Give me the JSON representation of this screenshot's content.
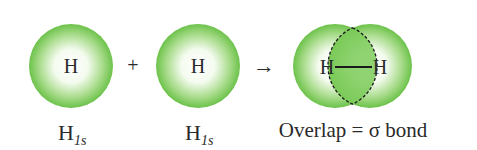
{
  "diagram": {
    "atoms": [
      {
        "symbol": "H",
        "label_main": "H",
        "label_sub": "1s"
      },
      {
        "symbol": "H",
        "label_main": "H",
        "label_sub": "1s"
      }
    ],
    "plus": "+",
    "arrow": "→",
    "molecule": {
      "left_symbol": "H",
      "right_symbol": "H",
      "caption": "Overlap = σ bond"
    },
    "colors": {
      "orbital_edge": "#6cc24a",
      "orbital_center": "#ffffff",
      "overlap_fill": "#7ccb5a",
      "bond_line": "#1a1a1a"
    }
  }
}
